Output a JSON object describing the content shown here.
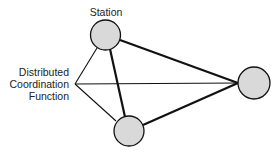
{
  "diagram": {
    "colors": {
      "background": "#ffffff",
      "node_fill": "#d9d9d9",
      "stroke": "#111111",
      "text": "#222222"
    },
    "labels": {
      "station": "Station",
      "dcf_line1": "Distributed",
      "dcf_line2": "Coordination",
      "dcf_line3": "Function"
    },
    "nodes": [
      {
        "id": "station-top",
        "cx": 105.5,
        "cy": 35,
        "r": 15
      },
      {
        "id": "station-bottom",
        "cx": 129,
        "cy": 131,
        "r": 15
      },
      {
        "id": "station-right",
        "cx": 254,
        "cy": 83,
        "r": 16
      }
    ],
    "edges": [
      {
        "from": "station-top",
        "to": "station-bottom",
        "weight": "thick"
      },
      {
        "from": "station-top",
        "to": "station-right",
        "weight": "thick"
      },
      {
        "from": "station-bottom",
        "to": "station-right",
        "weight": "thick"
      },
      {
        "from": "dcf-point",
        "to": "station-top",
        "weight": "thin"
      },
      {
        "from": "dcf-point",
        "to": "station-bottom",
        "weight": "thin"
      },
      {
        "from": "dcf-point",
        "to": "station-right",
        "weight": "thin"
      }
    ]
  }
}
